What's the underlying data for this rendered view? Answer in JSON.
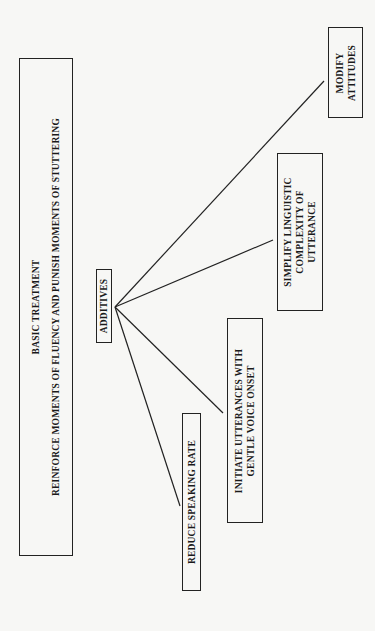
{
  "diagram": {
    "root": {
      "title": "BASIC TREATMENT",
      "subtitle": "REINFORCE MOMENTS OF FLUENCY AND PUNISH MOMENTS OF STUTTERING"
    },
    "hub": {
      "label": "ADDITIVES"
    },
    "branches": [
      {
        "lines": [
          "REDUCE SPEAKING RATE"
        ]
      },
      {
        "lines": [
          "INITIATE UTTERANCES WITH",
          "GENTLE VOICE ONSET"
        ]
      },
      {
        "lines": [
          "SIMPLIFY LINGUISTIC",
          "COMPLEXITY OF",
          "UTTERANCE"
        ]
      },
      {
        "lines": [
          "MODIFY",
          "ATTITUDES"
        ]
      }
    ],
    "orientation": "rotated 90 degrees counter-clockwise",
    "colors": {
      "ink": "#222222",
      "paper": "#f7f7f5"
    }
  }
}
